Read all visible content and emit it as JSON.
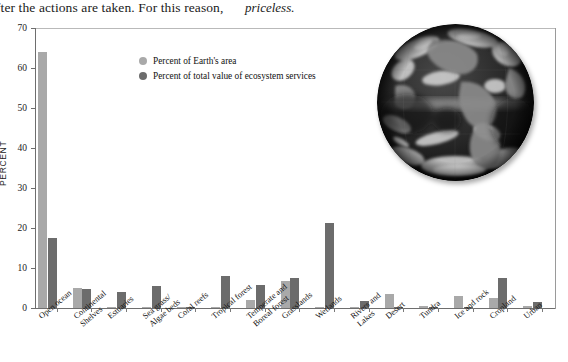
{
  "top_text": {
    "fragment_1": "fter the actions are taken. For this reason,",
    "fragment_2": "priceless."
  },
  "legend": {
    "position": "inside-top-left",
    "items": [
      {
        "label": "Percent of Earth's area",
        "color": "#a9a9a9",
        "marker": "circle"
      },
      {
        "label": "Percent of total value of ecosystem services",
        "color": "#6c6c6c",
        "marker": "circle"
      }
    ]
  },
  "figure": {
    "earth_photo_alt": "earth-photo",
    "earth_photo_name": "satellite-image-of-earth"
  },
  "chart_data": {
    "type": "bar",
    "title": "",
    "xlabel": "",
    "ylabel": "PERCENT",
    "ylim": [
      0,
      70
    ],
    "yticks": [
      0,
      10,
      20,
      30,
      40,
      50,
      60,
      70
    ],
    "ytick_labels": [
      "0",
      "10",
      "20",
      "30",
      "40",
      "50",
      "60",
      "70"
    ],
    "grid": false,
    "legend_position": "inside-top-left",
    "categories": [
      "Open ocean",
      "Continental\nShelves",
      "Estuaries",
      "Sea grass/\nAlgae beds",
      "Coral reefs",
      "Tropical forest",
      "Temperate and\nBoreal forest",
      "Grasslands",
      "Wetlands",
      "Rivers and\nLakes",
      "Desert",
      "Tundra",
      "Ice and rock",
      "Cropland",
      "Urban"
    ],
    "series": [
      {
        "name": "Percent of Earth's area",
        "color": "#a9a9a9",
        "values": [
          64.0,
          5.0,
          0.0,
          0.0,
          0.0,
          0.0,
          2.0,
          6.8,
          0.0,
          0.0,
          3.5,
          0.6,
          3.0,
          2.5,
          0.5
        ]
      },
      {
        "name": "Percent of total value of ecosystem services",
        "color": "#6c6c6c",
        "values": [
          17.5,
          4.7,
          4.0,
          5.5,
          0.3,
          8.0,
          5.8,
          7.5,
          21.2,
          1.8,
          0.2,
          0.3,
          0.2,
          7.5,
          1.5
        ]
      }
    ]
  }
}
